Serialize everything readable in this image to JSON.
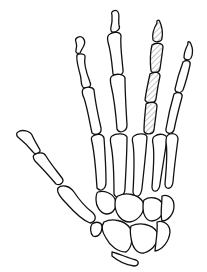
{
  "figure": {
    "highlighted_part": "ring-finger-phalanges",
    "highlight_style": "diagonal-hatch",
    "colors": {
      "line": "#111111",
      "background": "#ffffff",
      "hatch": "#888888"
    }
  }
}
